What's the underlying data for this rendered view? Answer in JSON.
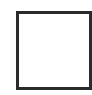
{
  "element": {
    "type": "checkbox",
    "checked": false,
    "border_color": "#2b2b2b",
    "fill_color": "#ffffff"
  }
}
